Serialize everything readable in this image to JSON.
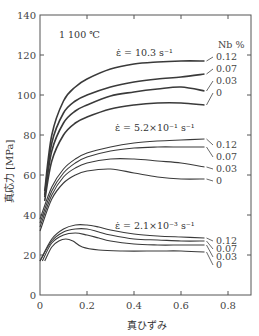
{
  "chart_data": {
    "type": "line",
    "title": "",
    "annotation_temperature": "1 100 ℃",
    "xlabel": "真ひずみ",
    "ylabel": "真応力 [MPa]",
    "xlim": [
      0,
      0.87
    ],
    "ylim": [
      0,
      140
    ],
    "xticks": [
      "0",
      "0.2",
      "0.4",
      "0.6",
      "0.8"
    ],
    "yticks": [
      "0",
      "20",
      "40",
      "60",
      "80",
      "100",
      "120",
      "140"
    ],
    "grid": false,
    "legend_title": "Nb %",
    "groups": [
      {
        "strain_rate_label": "ε̇ = 10.3 s⁻¹",
        "series": [
          {
            "name": "0.12",
            "x": [
              0.02,
              0.05,
              0.1,
              0.15,
              0.2,
              0.3,
              0.4,
              0.5,
              0.6,
              0.7
            ],
            "y": [
              52,
              80,
              97,
              104,
              108,
              113,
              115.5,
              116.5,
              117,
              117
            ]
          },
          {
            "name": "0.07",
            "x": [
              0.02,
              0.05,
              0.1,
              0.15,
              0.2,
              0.3,
              0.4,
              0.5,
              0.6,
              0.7
            ],
            "y": [
              50,
              76,
              91,
              97,
              100,
              104,
              106.5,
              108,
              109,
              110.5
            ]
          },
          {
            "name": "0.03",
            "x": [
              0.02,
              0.05,
              0.1,
              0.15,
              0.2,
              0.3,
              0.4,
              0.5,
              0.6,
              0.7
            ],
            "y": [
              49,
              72,
              86,
              92,
              95,
              99.5,
              101.5,
              103,
              104,
              102
            ]
          },
          {
            "name": "0",
            "x": [
              0.02,
              0.05,
              0.1,
              0.15,
              0.2,
              0.3,
              0.4,
              0.5,
              0.6,
              0.7
            ],
            "y": [
              47,
              67,
              80,
              86,
              89,
              93,
              95,
              96,
              96,
              95
            ]
          }
        ]
      },
      {
        "strain_rate_label": "ε̇ = 5.2×10⁻¹ s⁻¹",
        "series": [
          {
            "name": "0.12",
            "x": [
              0.0,
              0.05,
              0.1,
              0.15,
              0.2,
              0.3,
              0.4,
              0.5,
              0.6,
              0.7
            ],
            "y": [
              38,
              54,
              63,
              68,
              71,
              74,
              76,
              77,
              77.5,
              78
            ]
          },
          {
            "name": "0.07",
            "x": [
              0.0,
              0.05,
              0.1,
              0.15,
              0.2,
              0.3,
              0.4,
              0.5,
              0.6,
              0.7
            ],
            "y": [
              36,
              52,
              61,
              66,
              69,
              72,
              73.5,
              74,
              74,
              74
            ]
          },
          {
            "name": "0.03",
            "x": [
              0.0,
              0.05,
              0.1,
              0.15,
              0.2,
              0.3,
              0.4,
              0.5,
              0.6,
              0.7
            ],
            "y": [
              34,
              50,
              59,
              63.5,
              66,
              68,
              68,
              67,
              66,
              64
            ]
          },
          {
            "name": "0",
            "x": [
              0.0,
              0.05,
              0.1,
              0.15,
              0.2,
              0.3,
              0.4,
              0.5,
              0.6,
              0.7
            ],
            "y": [
              32,
              48,
              56,
              60,
              62,
              63,
              61,
              59,
              58,
              58
            ]
          }
        ]
      },
      {
        "strain_rate_label": "ε̇ = 2.1×10⁻³ s⁻¹",
        "series": [
          {
            "name": "0.12",
            "x": [
              0.0,
              0.05,
              0.1,
              0.15,
              0.2,
              0.25,
              0.3,
              0.4,
              0.5,
              0.6,
              0.7
            ],
            "y": [
              17,
              28,
              33,
              35,
              35,
              34,
              32.5,
              30.5,
              29.5,
              29,
              28.5
            ]
          },
          {
            "name": "0.07",
            "x": [
              0.0,
              0.05,
              0.1,
              0.15,
              0.2,
              0.25,
              0.3,
              0.4,
              0.5,
              0.6,
              0.7
            ],
            "y": [
              17,
              27,
              31.5,
              33,
              33,
              31.5,
              30,
              28,
              27.5,
              27,
              27
            ]
          },
          {
            "name": "0.03",
            "x": [
              0.01,
              0.05,
              0.1,
              0.15,
              0.2,
              0.25,
              0.3,
              0.4,
              0.5,
              0.6,
              0.7
            ],
            "y": [
              17,
              26,
              30,
              31,
              30,
              28.5,
              27,
              25.5,
              25,
              25,
              25
            ]
          },
          {
            "name": "0",
            "x": [
              0.02,
              0.05,
              0.08,
              0.11,
              0.14,
              0.18,
              0.25,
              0.35,
              0.5,
              0.6,
              0.7
            ],
            "y": [
              17,
              24,
              27,
              28,
              27,
              24,
              22.5,
              22,
              22,
              22,
              21.5
            ]
          }
        ]
      }
    ]
  },
  "labels": {
    "temperature": "1 100 ℃",
    "nb_header": "Nb %",
    "xlabel": "真ひずみ",
    "ylabel": "真応力 [MPa]",
    "rate_high": "ε̇ = 10.3 s⁻¹",
    "rate_mid": "ε̇ = 5.2×10⁻¹ s⁻¹",
    "rate_low": "ε̇ = 2.1×10⁻³ s⁻¹"
  }
}
